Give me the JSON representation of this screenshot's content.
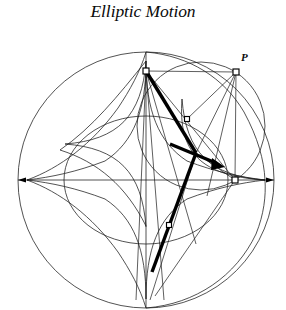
{
  "figure": {
    "title": "Elliptic Motion",
    "domain": "geometric-construction",
    "background_color": "#ffffff",
    "stroke_color": "#1a1a1a",
    "rod_color": "#000000",
    "marker_fill": "#ffffff",
    "width": 286,
    "height": 310
  },
  "labels": [
    {
      "text": "P",
      "x": 241,
      "y": 53,
      "style": "italic-bold"
    }
  ],
  "geometry": {
    "center": {
      "x": 146,
      "y": 180
    },
    "outer_circle": {
      "cx": 146,
      "cy": 180,
      "r": 128
    },
    "inner_circle": {
      "cx": 146,
      "cy": 180,
      "r": 64
    },
    "rolling_circle": {
      "cx": 201,
      "cy": 126,
      "r": 64
    },
    "astroid": {
      "cx": 146,
      "cy": 180,
      "a": 119
    },
    "horizontal_axis": {
      "x1": 18,
      "y1": 180,
      "x2": 274,
      "y2": 180
    },
    "vertical_axis": {
      "x1": 146,
      "y1": 52,
      "x2": 146,
      "y2": 308
    }
  },
  "nodes": [
    {
      "name": "rod-top-end",
      "x": 146,
      "y": 71,
      "size": 6
    },
    {
      "name": "point-p",
      "x": 236,
      "y": 72,
      "size": 6
    },
    {
      "name": "rod-upper-mid",
      "x": 187,
      "y": 119,
      "size": 5
    },
    {
      "name": "rod-axis-right",
      "x": 235,
      "y": 180,
      "size": 6
    },
    {
      "name": "rod-lower-mid",
      "x": 169,
      "y": 225,
      "size": 5
    }
  ],
  "rod": {
    "name": "trammel-rod",
    "start": {
      "x": 146,
      "y": 71
    },
    "end": {
      "x": 152,
      "y": 272
    },
    "pivot": {
      "x": 196,
      "y": 153
    },
    "arrow_tip": {
      "x": 224,
      "y": 166
    }
  },
  "annotations": {
    "curve_names": [
      "outer-circle",
      "astroid-envelope",
      "inner-circle",
      "rolling-circle",
      "construction-rays"
    ]
  }
}
